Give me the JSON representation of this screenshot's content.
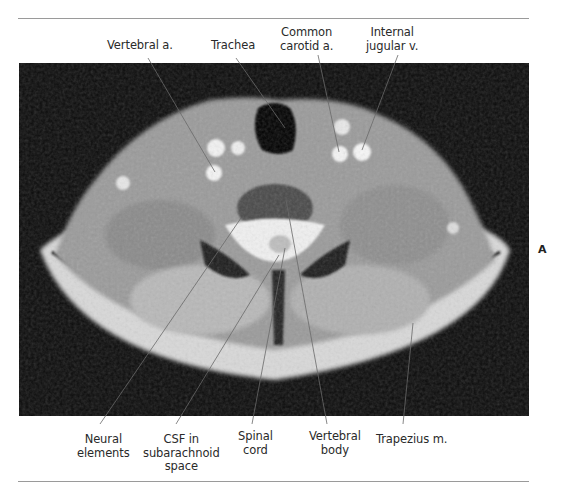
{
  "figure": {
    "panel_letter": "A",
    "image_type": "axial MRI cross-section of neck",
    "top_labels": [
      {
        "id": "vertebral-artery",
        "lines": [
          "Vertebral a."
        ]
      },
      {
        "id": "trachea",
        "lines": [
          "Trachea"
        ]
      },
      {
        "id": "common-carotid",
        "lines": [
          "Common",
          "carotid a."
        ]
      },
      {
        "id": "internal-jugular",
        "lines": [
          "Internal",
          "jugular v."
        ]
      }
    ],
    "bottom_labels": [
      {
        "id": "neural-elements",
        "lines": [
          "Neural",
          "elements"
        ]
      },
      {
        "id": "csf",
        "lines": [
          "CSF in",
          "subarachnoid",
          "space"
        ]
      },
      {
        "id": "spinal-cord",
        "lines": [
          "Spinal",
          "cord"
        ]
      },
      {
        "id": "vertebral-body",
        "lines": [
          "Vertebral",
          "body"
        ]
      },
      {
        "id": "trapezius",
        "lines": [
          "Trapezius m."
        ]
      }
    ]
  }
}
